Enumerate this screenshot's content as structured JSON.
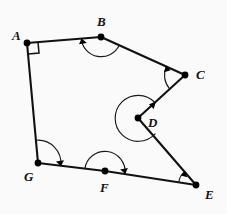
{
  "figure": {
    "kind": "geometry-diagram",
    "background_color": "#fafafa",
    "line_color": "#111111",
    "arc_color": "#1a1a1a",
    "label_color": "#111111",
    "width": 227,
    "height": 214
  },
  "vertices": [
    {
      "id": "A",
      "label": "A",
      "x": 27,
      "y": 43,
      "label_x": 12,
      "label_y": 29,
      "marker": "right-angle-square",
      "angle_type": "right"
    },
    {
      "id": "B",
      "label": "B",
      "x": 101,
      "y": 37,
      "label_x": 97,
      "label_y": 15,
      "marker": "arc-arrow",
      "angle_type": "obtuse"
    },
    {
      "id": "C",
      "label": "C",
      "x": 185,
      "y": 75,
      "label_x": 196,
      "label_y": 68,
      "marker": "arc-arrow",
      "angle_type": "acute"
    },
    {
      "id": "D",
      "label": "D",
      "x": 138,
      "y": 118,
      "label_x": 148,
      "label_y": 116,
      "marker": "reflex-arc-arrow",
      "angle_type": "reflex"
    },
    {
      "id": "E",
      "label": "E",
      "x": 196,
      "y": 185,
      "label_x": 205,
      "label_y": 188,
      "marker": "arc-arrow",
      "angle_type": "acute"
    },
    {
      "id": "F",
      "label": "F",
      "x": 105,
      "y": 171,
      "label_x": 100,
      "label_y": 181,
      "marker": "arc-arrow",
      "angle_type": "straight"
    },
    {
      "id": "G",
      "label": "G",
      "x": 38,
      "y": 163,
      "label_x": 24,
      "label_y": 170,
      "marker": "arc-arrow",
      "angle_type": "obtuse"
    }
  ],
  "edges": [
    {
      "from": "A",
      "to": "B"
    },
    {
      "from": "B",
      "to": "C"
    },
    {
      "from": "C",
      "to": "D"
    },
    {
      "from": "D",
      "to": "E"
    },
    {
      "from": "E",
      "to": "F"
    },
    {
      "from": "F",
      "to": "G"
    },
    {
      "from": "G",
      "to": "A"
    }
  ]
}
